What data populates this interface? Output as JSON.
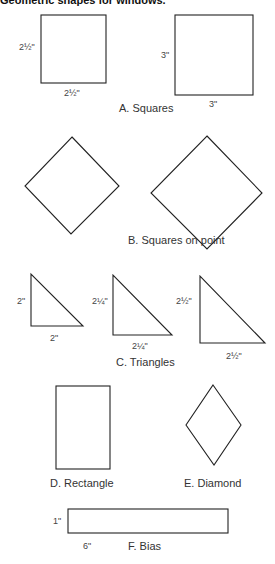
{
  "title": "Geometric shapes for windows.",
  "sections": {
    "a": {
      "caption": "A. Squares",
      "shapes": [
        {
          "side_label": "2½\"",
          "bottom_label": "2½\""
        },
        {
          "side_label": "3\"",
          "bottom_label": "3\""
        }
      ]
    },
    "b": {
      "caption": "B. Squares on point"
    },
    "c": {
      "caption": "C. Triangles",
      "shapes": [
        {
          "side_label": "2\"",
          "bottom_label": "2\""
        },
        {
          "side_label": "2¼\"",
          "bottom_label": "2¼\""
        },
        {
          "side_label": "2½\"",
          "bottom_label": "2½\""
        }
      ]
    },
    "d": {
      "caption": "D. Rectangle"
    },
    "e": {
      "caption": "E. Diamond"
    },
    "f": {
      "caption": "F. Bias",
      "side_label": "1\"",
      "bottom_label": "6\""
    }
  },
  "colors": {
    "stroke": "#222222",
    "background": "#ffffff"
  }
}
